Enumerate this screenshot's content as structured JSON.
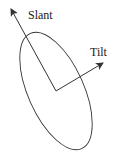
{
  "diagram": {
    "labels": {
      "slant": "Slant",
      "tilt": "Tilt"
    },
    "colors": {
      "stroke": "#333333",
      "background": "#ffffff"
    },
    "ellipse": {
      "cx": 56,
      "cy": 91,
      "rx": 28,
      "ry": 63,
      "rotation_deg": -24
    },
    "origin": {
      "x": 56,
      "y": 91
    },
    "slant_arrow_tip": {
      "x": 11,
      "y": 9
    },
    "tilt_arrow_tip": {
      "x": 103,
      "y": 63
    }
  }
}
